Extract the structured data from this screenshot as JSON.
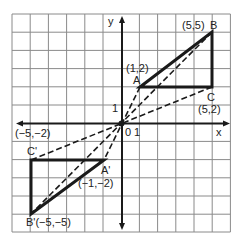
{
  "diagram": {
    "type": "coordinate-plane-transformation",
    "grid": {
      "xmin": -6,
      "xmax": 6,
      "ymin": -6,
      "ymax": 6,
      "step": 1
    },
    "axes": {
      "x_label": "x",
      "y_label": "y",
      "origin_label": "0",
      "x_tick_label": "1",
      "y_tick_label": "1"
    },
    "triangle_original": {
      "vertices": [
        {
          "name": "A",
          "coord": "(1,2)",
          "x": 1,
          "y": 2
        },
        {
          "name": "B",
          "coord": "(5,5)",
          "x": 5,
          "y": 5
        },
        {
          "name": "C",
          "coord": "(5,2)",
          "x": 5,
          "y": 2
        }
      ]
    },
    "triangle_image": {
      "vertices": [
        {
          "name": "A'",
          "coord": "(−1,−2)",
          "x": -1,
          "y": -2
        },
        {
          "name": "B'",
          "coord": "(−5,−5)",
          "x": -5,
          "y": -5
        },
        {
          "name": "C'",
          "coord": "(−5,−2)",
          "x": -5,
          "y": -2
        }
      ]
    },
    "labels": {
      "A": "A",
      "A_coord": "(1,2)",
      "B": "B",
      "B_coord": "(5,5)",
      "C": "C",
      "C_coord": "(5,2)",
      "A_prime": "A'",
      "A_prime_coord": "(−1,−2)",
      "B_prime_full": "B'(−5,−5)",
      "C_prime": "C'",
      "C_prime_coord": "(−5,−2)"
    },
    "colors": {
      "grid": "#8a8a8a",
      "lines": "#1a1a1a",
      "background": "#ffffff"
    }
  }
}
